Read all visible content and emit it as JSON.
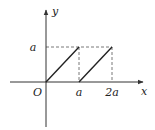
{
  "diagram": {
    "axes": {
      "x_label": "x",
      "y_label": "y",
      "origin_label": "O"
    },
    "ticks": {
      "x": [
        {
          "value": 1,
          "label": "a"
        },
        {
          "value": 2,
          "label": "2a"
        }
      ],
      "y": [
        {
          "value": 1,
          "label": "a"
        }
      ]
    },
    "segments": [
      {
        "from": [
          0,
          0
        ],
        "to": [
          1,
          1
        ]
      },
      {
        "from": [
          1,
          0
        ],
        "to": [
          2,
          1
        ]
      }
    ],
    "guides": [
      {
        "from": [
          0,
          1
        ],
        "to": [
          2,
          1
        ]
      },
      {
        "from": [
          1,
          1
        ],
        "to": [
          1,
          0
        ]
      },
      {
        "from": [
          2,
          1
        ],
        "to": [
          2,
          0
        ]
      }
    ],
    "colors": {
      "line": "#222222",
      "axis": "#333333",
      "guide": "#555555"
    }
  }
}
